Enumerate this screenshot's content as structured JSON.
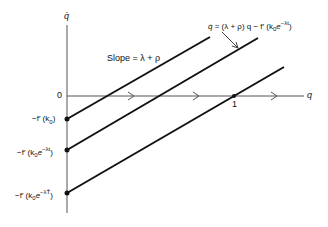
{
  "axes": {
    "y_label": "q̇",
    "x_label": "q",
    "origin_label": "0"
  },
  "equation_label": "q̇ = (λ + ρ) q − f′(k₀e⁻ᵏᵗ)",
  "equation": {
    "lhs": "q̇",
    "mid": " = (λ + ρ) q − f′ (k",
    "sub": "0",
    "e": "e",
    "sup": "−λt",
    "close": ")"
  },
  "slope_label": "Slope = λ + ρ",
  "unit_point_label": "1",
  "intercepts": [
    {
      "pre": "−f′ (k",
      "sub": "0",
      "post": ")",
      "sup": ""
    },
    {
      "pre": "−f′ (k",
      "sub": "0",
      "post": ")",
      "sup": "−λt"
    },
    {
      "pre": "−f′ (k",
      "sub": "0",
      "post": ")",
      "sup": "−λT̄"
    }
  ],
  "colors": {
    "line": "#111111",
    "axis": "#555555",
    "background": "#ffffff"
  }
}
